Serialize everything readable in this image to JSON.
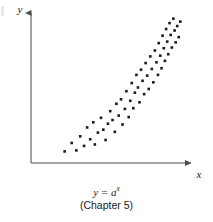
{
  "figure": {
    "axis_x_label": "x",
    "axis_y_label": "y",
    "caption_formula_lhs": "y",
    "caption_formula_eq": " = ",
    "caption_formula_base": "a",
    "caption_formula_exp": "x",
    "caption_chapter": "(Chapter 5)",
    "ink_color": "#1a1a1a",
    "axis_color": "#7a7a7a",
    "point_color": "#1a1a1a",
    "background_color": "#ffffff"
  },
  "chart_data": {
    "type": "scatter",
    "title": "",
    "subtitle": "",
    "xlabel": "x",
    "ylabel": "y",
    "caption": "y = a^x (Chapter 5)",
    "grid": false,
    "legend": false,
    "axis_arrows": true,
    "relationship": "exponential growth",
    "xlim": [
      0,
      100
    ],
    "ylim": [
      0,
      100
    ],
    "marker_size_px": 2.6,
    "marker_shape": "square",
    "n_points": 61,
    "points": [
      [
        19.9,
        5.8
      ],
      [
        24.5,
        11.5
      ],
      [
        27.5,
        6.5
      ],
      [
        30.0,
        16.0
      ],
      [
        32.5,
        9.5
      ],
      [
        34.5,
        22.0
      ],
      [
        36.5,
        14.0
      ],
      [
        38.5,
        25.5
      ],
      [
        39.5,
        10.5
      ],
      [
        41.5,
        18.5
      ],
      [
        43.5,
        28.5
      ],
      [
        45.0,
        20.5
      ],
      [
        46.5,
        13.5
      ],
      [
        48.0,
        24.5
      ],
      [
        49.5,
        33.0
      ],
      [
        51.0,
        27.0
      ],
      [
        52.5,
        19.0
      ],
      [
        53.5,
        38.0
      ],
      [
        55.0,
        30.0
      ],
      [
        56.5,
        41.0
      ],
      [
        57.5,
        24.0
      ],
      [
        59.0,
        34.5
      ],
      [
        60.0,
        46.5
      ],
      [
        61.5,
        29.0
      ],
      [
        62.5,
        40.0
      ],
      [
        63.5,
        52.0
      ],
      [
        64.5,
        35.0
      ],
      [
        65.5,
        45.5
      ],
      [
        66.5,
        57.5
      ],
      [
        67.5,
        49.0
      ],
      [
        68.5,
        39.0
      ],
      [
        69.5,
        61.0
      ],
      [
        70.5,
        53.5
      ],
      [
        71.5,
        44.5
      ],
      [
        72.5,
        65.5
      ],
      [
        73.5,
        57.0
      ],
      [
        74.5,
        48.0
      ],
      [
        75.5,
        70.0
      ],
      [
        76.5,
        61.5
      ],
      [
        77.5,
        52.5
      ],
      [
        78.5,
        74.0
      ],
      [
        79.5,
        66.0
      ],
      [
        80.5,
        57.5
      ],
      [
        81.0,
        79.0
      ],
      [
        82.0,
        70.5
      ],
      [
        82.8,
        62.0
      ],
      [
        83.5,
        84.0
      ],
      [
        84.3,
        75.5
      ],
      [
        85.0,
        67.0
      ],
      [
        85.8,
        88.5
      ],
      [
        86.5,
        80.0
      ],
      [
        87.2,
        71.5
      ],
      [
        88.0,
        92.5
      ],
      [
        88.8,
        84.5
      ],
      [
        89.5,
        76.0
      ],
      [
        90.5,
        95.5
      ],
      [
        91.3,
        87.5
      ],
      [
        92.0,
        79.5
      ],
      [
        93.0,
        90.5
      ],
      [
        94.0,
        83.0
      ],
      [
        95.0,
        93.5
      ]
    ]
  }
}
